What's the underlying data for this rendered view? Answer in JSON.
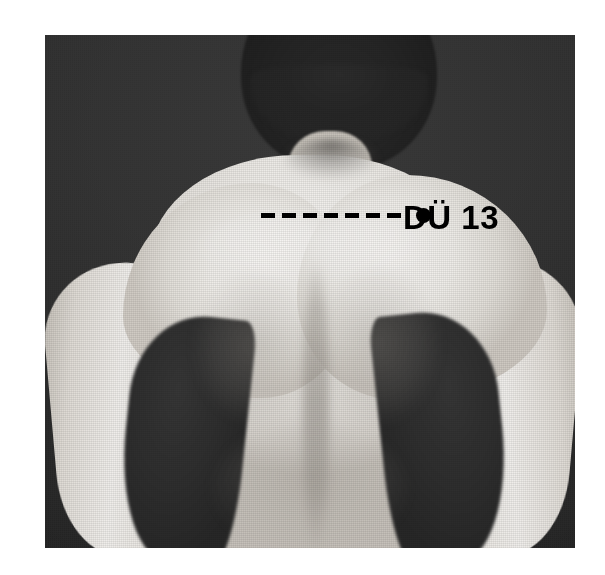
{
  "plate": {
    "background_color": "#ffffff",
    "photo": {
      "kind": "black-and-white halftone photograph",
      "subject": "bare upper back of a person viewed from behind",
      "frame": {
        "x": 45,
        "y": 35,
        "width": 530,
        "height": 513
      },
      "backdrop_color": "#2c2c2c",
      "skin_highlight_color": "#f2f0ed",
      "skin_shadow_color": "#c6c1ba",
      "hair_color": "#262626"
    },
    "annotation": {
      "ink_color": "#000000",
      "point_label": "DÜ 13",
      "leader_dash_count": 7,
      "marker": {
        "shape": "filled-circle",
        "x": 371,
        "y": 173,
        "diameter": 15
      },
      "leader_line": {
        "style": "dashed",
        "start_x": 216,
        "end_x": 366,
        "y": 178,
        "dash_length": 14,
        "dash_gap": 7,
        "thickness": 5
      },
      "label_position": {
        "x": 358,
        "y": 166
      }
    }
  }
}
